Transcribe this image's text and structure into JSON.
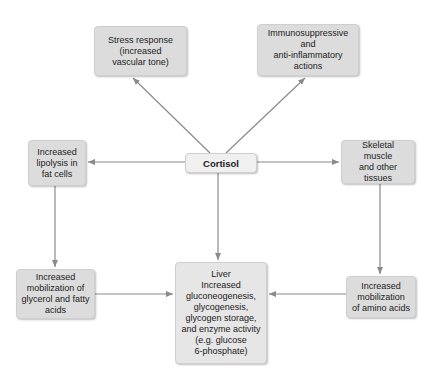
{
  "diagram": {
    "center": {
      "id": "cortisol",
      "label": "Cortisol"
    },
    "nodes": [
      {
        "id": "stress",
        "label": "Stress response\n(increased\nvascular tone)"
      },
      {
        "id": "immuno",
        "label": "Immunosuppressive\nand\nanti-inflammatory\nactions"
      },
      {
        "id": "lipolysis",
        "label": "Increased\nlipolysis in\nfat cells"
      },
      {
        "id": "skeletal",
        "label": "Skeletal\nmuscle\nand other tissues"
      },
      {
        "id": "glycerol",
        "label": "Increased\nmobilization of\nglycerol and fatty\nacids"
      },
      {
        "id": "liver",
        "label": "Liver\nIncreased\ngluconeogenesis,\nglycogenesis,\nglycogen storage,\nand enzyme activity\n(e.g. glucose\n6-phosphate)"
      },
      {
        "id": "amino",
        "label": "Increased\nmobilization\nof amino acids"
      }
    ],
    "edges": [
      {
        "from": "cortisol",
        "to": "stress"
      },
      {
        "from": "cortisol",
        "to": "immuno"
      },
      {
        "from": "cortisol",
        "to": "lipolysis"
      },
      {
        "from": "cortisol",
        "to": "skeletal"
      },
      {
        "from": "cortisol",
        "to": "liver"
      },
      {
        "from": "lipolysis",
        "to": "glycerol"
      },
      {
        "from": "skeletal",
        "to": "amino"
      },
      {
        "from": "glycerol",
        "to": "liver"
      },
      {
        "from": "amino",
        "to": "liver"
      }
    ],
    "colors": {
      "box_fill": "#dcdcdc",
      "center_fill": "#f0f0f0",
      "arrow": "#8a8a8a"
    }
  }
}
